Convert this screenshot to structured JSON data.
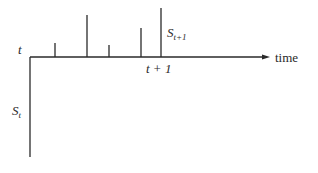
{
  "diagram": {
    "type": "spike-train timeline",
    "labels": {
      "t": "t",
      "time": "time",
      "t_plus_1": "t + 1",
      "s_t_base": "S",
      "s_t_sub": "t",
      "s_t1_base": "S",
      "s_t1_sub": "t+1"
    },
    "axis": {
      "origin_x": 30,
      "axis_y": 57,
      "end_x": 270,
      "vertical_bottom_y": 157
    },
    "spikes": [
      {
        "x": 55,
        "top": 43
      },
      {
        "x": 87,
        "top": 15
      },
      {
        "x": 109,
        "top": 45
      },
      {
        "x": 141,
        "top": 28
      },
      {
        "x": 161,
        "top": 8
      }
    ],
    "color": "#2a2a2a"
  }
}
